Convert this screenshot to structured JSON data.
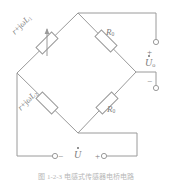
{
  "figure": {
    "type": "circuit-diagram",
    "caption": "图 1-2-3   电感式传感器电桥电路"
  },
  "colors": {
    "wire": "#9a9a9a",
    "text": "#7d7d7d",
    "background": "#ffffff",
    "caption": "#b7b7b7"
  },
  "bridge": {
    "arms": [
      {
        "id": "upper-left",
        "label_prefix": "r+j",
        "label_omega": "ω",
        "label_L": "L",
        "label_sub": "1",
        "label_full": "r+jωL₁",
        "kind": "inductor-variable"
      },
      {
        "id": "lower-left",
        "label_prefix": "r+j",
        "label_omega": "ω",
        "label_L": "L",
        "label_sub": "2",
        "label_full": "r+jωL₂",
        "kind": "inductor"
      },
      {
        "id": "upper-right",
        "label_R": "R",
        "label_sub": "0",
        "label_full": "R₀",
        "kind": "resistor"
      },
      {
        "id": "lower-right",
        "label_R": "R",
        "label_sub": "0",
        "label_full": "R₀",
        "kind": "resistor"
      }
    ]
  },
  "output_port": {
    "name": "output-voltage",
    "symbol": "U",
    "symbol_sub": "o",
    "symbol_full": "U̇ₒ",
    "plus_label": "+",
    "minus_label": "−"
  },
  "source_port": {
    "name": "source-voltage",
    "symbol": "U",
    "symbol_full": "U̇",
    "plus_label": "+",
    "minus_label": "−"
  }
}
